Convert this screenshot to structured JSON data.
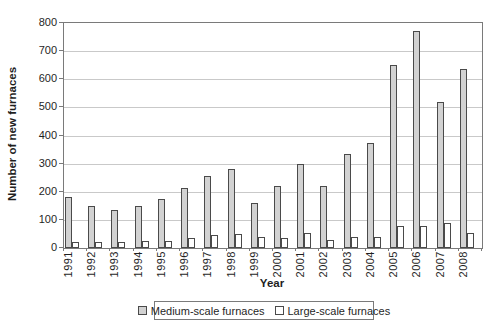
{
  "chart_data": {
    "type": "bar",
    "title": "",
    "categories": [
      "1991",
      "1992",
      "1993",
      "1994",
      "1995",
      "1996",
      "1997",
      "1998",
      "1999",
      "2000",
      "2001",
      "2002",
      "2003",
      "2004",
      "2005",
      "2006",
      "2007",
      "2008"
    ],
    "series": [
      {
        "name": "Medium-scale furnaces",
        "color": "#d2d2d2",
        "values": [
          180,
          150,
          135,
          150,
          175,
          215,
          255,
          280,
          160,
          220,
          300,
          220,
          335,
          375,
          650,
          770,
          520,
          635
        ]
      },
      {
        "name": "Large-scale furnaces",
        "color": "#ffffff",
        "values": [
          20,
          20,
          20,
          25,
          25,
          35,
          45,
          50,
          40,
          35,
          55,
          30,
          40,
          40,
          80,
          80,
          90,
          55
        ]
      }
    ],
    "xlabel": "Year",
    "ylabel": "Number of new furnaces",
    "ylim": [
      0,
      800
    ],
    "ytick_step": 100,
    "grid": true,
    "legend_position": "bottom",
    "colors": {
      "bar_border": "#4a4a4a",
      "gridline": "#c9c9c9",
      "axis_frame": "#7a7a7a",
      "text": "#1f1f1f",
      "background": "#ffffff"
    }
  }
}
